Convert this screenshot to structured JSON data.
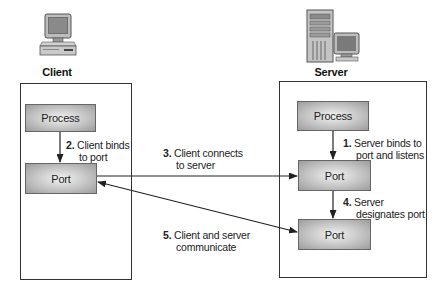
{
  "client": {
    "label": "Client",
    "icon": "desktop-computer-icon",
    "process_label": "Process",
    "port_label": "Port"
  },
  "server": {
    "label": "Server",
    "icon": "server-tower-with-monitor-icon",
    "process_label": "Process",
    "port_label": "Port",
    "designated_port_label": "Port"
  },
  "steps": [
    {
      "num": "1.",
      "line1": "Server binds to",
      "line2": "port and listens"
    },
    {
      "num": "2.",
      "line1": "Client binds",
      "line2": "to port"
    },
    {
      "num": "3.",
      "line1": "Client connects",
      "line2": "to server"
    },
    {
      "num": "4.",
      "line1": "Server",
      "line2": "designates port"
    },
    {
      "num": "5.",
      "line1": "Client and server",
      "line2": "communicate"
    }
  ],
  "colors": {
    "border": "#333333",
    "node_light": "#f2f2f2",
    "node_dark": "#9c9c9c",
    "arrow": "#222222"
  }
}
